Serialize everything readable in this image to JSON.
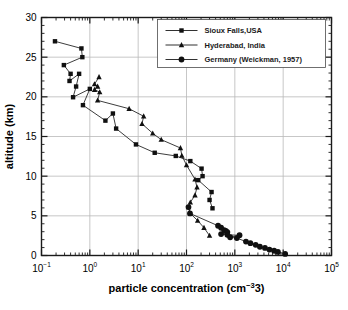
{
  "chart_data": {
    "type": "line",
    "title": "",
    "xlabel": "particle concentration (cm−3)",
    "ylabel": "altitude (km)",
    "xscale": "log",
    "yscale": "linear",
    "xlim": [
      0.1,
      100000
    ],
    "ylim": [
      0,
      30
    ],
    "grid": true,
    "legend_position": "top-right",
    "x_tick_labels": [
      "10⁻¹",
      "10⁰",
      "10¹",
      "10²",
      "10³",
      "10⁴",
      "10⁵"
    ],
    "x_ticks": [
      {
        "base": "10",
        "exp": "-1",
        "value": 0.1
      },
      {
        "base": "10",
        "exp": "0",
        "value": 1
      },
      {
        "base": "10",
        "exp": "1",
        "value": 10
      },
      {
        "base": "10",
        "exp": "2",
        "value": 100
      },
      {
        "base": "10",
        "exp": "3",
        "value": 1000
      },
      {
        "base": "10",
        "exp": "4",
        "value": 10000
      },
      {
        "base": "10",
        "exp": "5",
        "value": 100000
      }
    ],
    "y_ticks": [
      0,
      5,
      10,
      15,
      20,
      25,
      30
    ],
    "y_minor_tick_step": 1,
    "series": [
      {
        "name": "Sioux Falls,USA",
        "marker": "square",
        "color": "#101010",
        "points": [
          {
            "x": 0.19,
            "y": 27.0
          },
          {
            "x": 0.67,
            "y": 26.1
          },
          {
            "x": 0.7,
            "y": 25.0
          },
          {
            "x": 0.29,
            "y": 24.0
          },
          {
            "x": 0.4,
            "y": 22.9
          },
          {
            "x": 0.38,
            "y": 22.0
          },
          {
            "x": 0.6,
            "y": 22.9
          },
          {
            "x": 0.52,
            "y": 21.3
          },
          {
            "x": 0.45,
            "y": 19.95
          },
          {
            "x": 1.0,
            "y": 21.0
          },
          {
            "x": 0.72,
            "y": 18.95
          },
          {
            "x": 2.1,
            "y": 17.0
          },
          {
            "x": 3.0,
            "y": 17.9
          },
          {
            "x": 3.5,
            "y": 16.0
          },
          {
            "x": 9.0,
            "y": 14.0
          },
          {
            "x": 22.0,
            "y": 12.95
          },
          {
            "x": 60.0,
            "y": 12.55
          },
          {
            "x": 120.0,
            "y": 11.9
          },
          {
            "x": 205.0,
            "y": 10.95
          },
          {
            "x": 215.0,
            "y": 10.0
          },
          {
            "x": 175.0,
            "y": 9.5
          },
          {
            "x": 330.0,
            "y": 8.0
          },
          {
            "x": 300.0,
            "y": 7.0
          },
          {
            "x": 345.0,
            "y": 5.95
          }
        ]
      },
      {
        "name": "Hyderabad, India",
        "marker": "triangle",
        "color": "#101010",
        "points": [
          {
            "x": 1.55,
            "y": 22.5
          },
          {
            "x": 1.25,
            "y": 21.6
          },
          {
            "x": 1.45,
            "y": 21.3
          },
          {
            "x": 1.25,
            "y": 20.9
          },
          {
            "x": 1.6,
            "y": 20.6
          },
          {
            "x": 1.45,
            "y": 19.55
          },
          {
            "x": 6.5,
            "y": 18.5
          },
          {
            "x": 13.0,
            "y": 17.55
          },
          {
            "x": 12.0,
            "y": 16.6
          },
          {
            "x": 20.0,
            "y": 15.4
          },
          {
            "x": 30.0,
            "y": 14.6
          },
          {
            "x": 75.0,
            "y": 13.55
          },
          {
            "x": 80.0,
            "y": 12.6
          },
          {
            "x": 100.0,
            "y": 11.4
          },
          {
            "x": 150.0,
            "y": 9.6
          },
          {
            "x": 165.0,
            "y": 8.6
          },
          {
            "x": 150.0,
            "y": 7.6
          },
          {
            "x": 120.0,
            "y": 6.7
          },
          {
            "x": 110.0,
            "y": 6.1
          },
          {
            "x": 120.0,
            "y": 5.3
          },
          {
            "x": 170.0,
            "y": 4.4
          },
          {
            "x": 230.0,
            "y": 3.5
          },
          {
            "x": 300.0,
            "y": 2.5
          }
        ]
      },
      {
        "name": "Germany (Weickman, 1957)",
        "marker": "circle",
        "color": "#101010",
        "points": [
          {
            "x": 110.0,
            "y": 6.1
          },
          {
            "x": 118.0,
            "y": 5.3
          },
          {
            "x": 450.0,
            "y": 3.75
          },
          {
            "x": 520.0,
            "y": 3.5
          },
          {
            "x": 600.0,
            "y": 3.2
          },
          {
            "x": 650.0,
            "y": 3.1
          },
          {
            "x": 700.0,
            "y": 2.95
          },
          {
            "x": 520.0,
            "y": 2.7
          },
          {
            "x": 700.0,
            "y": 2.6
          },
          {
            "x": 1250.0,
            "y": 2.55
          },
          {
            "x": 800.0,
            "y": 2.3
          },
          {
            "x": 1100.0,
            "y": 2.2
          },
          {
            "x": 1700.0,
            "y": 1.75
          },
          {
            "x": 2100.0,
            "y": 1.55
          },
          {
            "x": 2700.0,
            "y": 1.35
          },
          {
            "x": 3300.0,
            "y": 1.1
          },
          {
            "x": 4200.0,
            "y": 0.95
          },
          {
            "x": 5200.0,
            "y": 0.75
          },
          {
            "x": 6500.0,
            "y": 0.6
          },
          {
            "x": 7800.0,
            "y": 0.45
          },
          {
            "x": 11000.0,
            "y": 0.2
          }
        ]
      }
    ]
  }
}
